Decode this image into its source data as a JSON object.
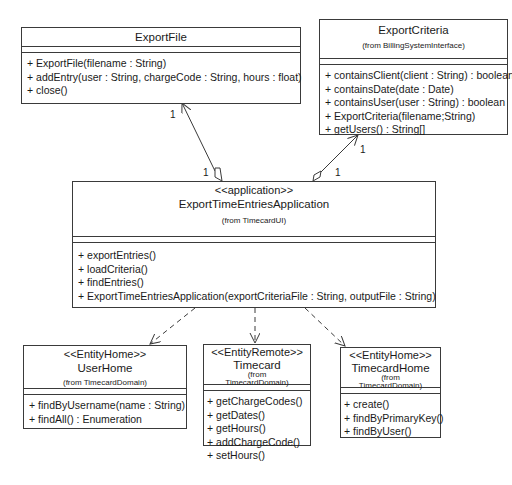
{
  "diagram": {
    "type": "UML class diagram",
    "classes": {
      "export_file": {
        "name": "ExportFile",
        "operations": [
          "+ ExportFile(filename : String)",
          "+ addEntry(user : String, chargeCode : String, hours : float)",
          "+ close()"
        ]
      },
      "export_criteria": {
        "name": "ExportCriteria",
        "from": "(from BillingSystemInterface)",
        "operations": [
          "+ containsClient(client : String) : boolean",
          "+ containsDate(date : Date)",
          "+ containsUser(user : String) : boolean",
          "+ ExportCriteria(filename;String)",
          "+ getUsers() : String[]"
        ]
      },
      "export_app": {
        "stereotype": "<<application>>",
        "name": "ExportTimeEntriesApplication",
        "from": "(from TimecardUI)",
        "operations": [
          "+ exportEntries()",
          "+ loadCriteria()",
          "+ findEntries()",
          "+ ExportTimeEntriesApplication(exportCriteriaFile : String, outputFile : String)"
        ]
      },
      "user_home": {
        "stereotype": "<<EntityHome>>",
        "name": "UserHome",
        "from": "(from TimecardDomain)",
        "operations": [
          "+ findByUsername(name : String)",
          "+ findAll() : Enumeration"
        ]
      },
      "timecard": {
        "stereotype": "<<EntityRemote>>",
        "name": "Timecard",
        "from_line1": "(from",
        "from_line2": "TimecardDomain)",
        "operations": [
          "+ getChargeCodes()",
          "+ getDates()",
          "+ getHours()",
          "+ addChargeCode()",
          "+ setHours()"
        ]
      },
      "timecard_home": {
        "stereotype": "<<EntityHome>>",
        "name": "TimecardHome",
        "from_line1": "(from",
        "from_line2": "TimecardDomain)",
        "operations": [
          "+ create()",
          "+ findByPrimaryKey()",
          "+ findByUser()"
        ]
      }
    },
    "associations": {
      "app_to_exportfile": {
        "source_multiplicity": "1",
        "target_multiplicity": "1",
        "kind": "aggregation"
      },
      "app_to_exportcriteria": {
        "source_multiplicity": "1",
        "target_multiplicity": "1",
        "kind": "aggregation"
      }
    },
    "dependencies": [
      "UserHome",
      "Timecard",
      "TimecardHome"
    ],
    "colors": {
      "line": "#3a3a3a",
      "background": "#ffffff",
      "text": "#1a1a1a"
    }
  }
}
